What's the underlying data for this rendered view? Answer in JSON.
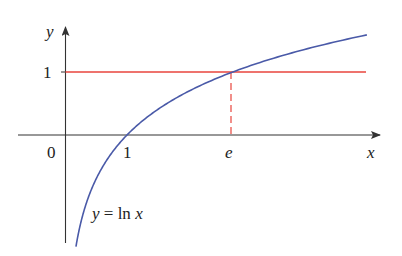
{
  "figure": {
    "axis_labels": {
      "x": "x",
      "y": "y"
    },
    "tick_labels": {
      "origin": "0",
      "x_one": "1",
      "x_e": "e",
      "y_one": "1"
    },
    "curve_label": {
      "lhs": "y",
      "eq": " = ",
      "rhs": "ln ",
      "var": "x"
    },
    "colors": {
      "curve": "#4a5aa8",
      "line": "#e8453c",
      "axes": "#333333"
    }
  },
  "chart_data": {
    "type": "line",
    "title": "",
    "xlabel": "x",
    "ylabel": "y",
    "series": [
      {
        "name": "y = ln x",
        "function": "ln(x)",
        "color": "#4a5aa8",
        "x_range": [
          0.17,
          4.9
        ]
      },
      {
        "name": "y = 1",
        "function": "1",
        "color": "#e8453c",
        "x_range": [
          0,
          4.9
        ]
      }
    ],
    "annotations": [
      {
        "type": "dashed-vertical",
        "x": 2.718,
        "from_y": 0,
        "to_y": 1,
        "label": "e"
      },
      {
        "type": "intersection",
        "x": 2.718,
        "y": 1
      }
    ],
    "x_ticks": [
      "0",
      "1",
      "e"
    ],
    "y_ticks": [
      "1"
    ],
    "grid": false
  }
}
